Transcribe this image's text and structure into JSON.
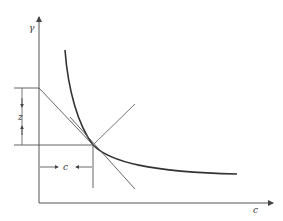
{
  "diagram": {
    "type": "economics-indifference-curve",
    "axes": {
      "y_label": "γ",
      "x_label": "c"
    },
    "annotations": {
      "vertical_gap_label": "z",
      "horizontal_gap_label": "c"
    },
    "elements": [
      "convex downward-sloping curve",
      "tangent line touching curve at tangency point",
      "line from upper-left kink at y-axis through tangency point",
      "ray crossing through tangency point",
      "dimension arrow z between two horizontal levels",
      "dimension arrow c between y-axis and tangency x"
    ],
    "colors": {
      "curve": "#333333",
      "lines": "#555555",
      "background": "#ffffff"
    }
  }
}
